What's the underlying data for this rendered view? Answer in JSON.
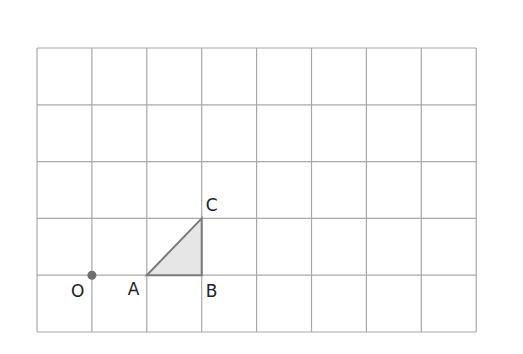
{
  "diagram": {
    "type": "grid-geometry",
    "grid": {
      "columns": 8,
      "rows": 5,
      "left": 37,
      "top": 48,
      "cell_width": 54.9,
      "cell_height": 56.8,
      "line_color": "#a8a8a8"
    },
    "point_O": {
      "label": "O",
      "grid": [
        1,
        4
      ],
      "color": "#6e6e6e"
    },
    "triangle": {
      "fill": "#e6e6e6",
      "stroke": "#7a7a7a",
      "vertices": [
        {
          "label": "A",
          "grid": [
            2,
            4
          ]
        },
        {
          "label": "B",
          "grid": [
            3,
            4
          ]
        },
        {
          "label": "C",
          "grid": [
            3,
            3
          ]
        }
      ]
    },
    "labels": {
      "O": "O",
      "A": "A",
      "B": "B",
      "C": "C"
    }
  }
}
